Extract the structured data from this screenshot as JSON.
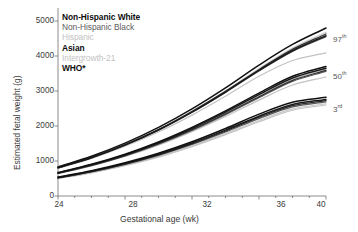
{
  "chart_data": {
    "type": "line",
    "title": "",
    "xlabel": "Gestational age (wk)",
    "ylabel": "Estimated fetal weight (g)",
    "xlim": [
      24,
      40
    ],
    "ylim": [
      0,
      5000
    ],
    "xticks": [
      24,
      28,
      32,
      36,
      40
    ],
    "yticks": [
      0,
      1000,
      2000,
      3000,
      4000,
      5000
    ],
    "xtick_labels": [
      "24",
      "28",
      "32",
      "36",
      "40"
    ],
    "ytick_labels": [
      "0",
      "1000",
      "2000",
      "3000",
      "4000",
      "5000"
    ],
    "grid": false,
    "legend_position": "upper-left",
    "x": [
      24,
      26,
      28,
      30,
      32,
      34,
      36,
      38,
      40
    ],
    "percentile_bands": [
      {
        "name": "97th",
        "label_text": "97",
        "label_suffix": "th",
        "series": [
          {
            "name": "Non-Hispanic White",
            "values": [
              830,
              1135,
              1510,
              1960,
              2490,
              3090,
              3740,
              4330,
              4800
            ]
          },
          {
            "name": "Non-Hispanic Black",
            "values": [
              800,
              1090,
              1450,
              1880,
              2390,
              2960,
              3570,
              4130,
              4550
            ]
          },
          {
            "name": "Hispanic",
            "values": [
              815,
              1110,
              1480,
              1915,
              2430,
              3010,
              3640,
              4230,
              4680
            ]
          },
          {
            "name": "Asian",
            "values": [
              805,
              1095,
              1455,
              1885,
              2395,
              2970,
              3590,
              4150,
              4580
            ]
          },
          {
            "name": "Intergrowth-21",
            "values": [
              790,
              1070,
              1420,
              1830,
              2310,
              2850,
              3420,
              3870,
              4090
            ]
          },
          {
            "name": "WHO*",
            "values": [
              810,
              1105,
              1470,
              1900,
              2415,
              2990,
              3610,
              4190,
              4630
            ]
          }
        ]
      },
      {
        "name": "50th",
        "label_text": "50",
        "label_suffix": "th",
        "series": [
          {
            "name": "Non-Hispanic White",
            "values": [
              670,
              905,
              1195,
              1545,
              1960,
              2430,
              2940,
              3420,
              3700
            ]
          },
          {
            "name": "Non-Hispanic Black",
            "values": [
              645,
              870,
              1145,
              1480,
              1875,
              2325,
              2810,
              3275,
              3560
            ]
          },
          {
            "name": "Hispanic",
            "values": [
              655,
              885,
              1165,
              1505,
              1910,
              2370,
              2865,
              3335,
              3620
            ]
          },
          {
            "name": "Asian",
            "values": [
              660,
              892,
              1175,
              1520,
              1930,
              2395,
              2895,
              3370,
              3650
            ]
          },
          {
            "name": "Intergrowth-21",
            "values": [
              640,
              860,
              1130,
              1455,
              1840,
              2275,
              2740,
              3170,
              3400
            ]
          },
          {
            "name": "WHO*",
            "values": [
              650,
              878,
              1155,
              1492,
              1892,
              2348,
              2838,
              3305,
              3590
            ]
          }
        ]
      },
      {
        "name": "3rd",
        "label_text": "3",
        "label_suffix": "rd",
        "series": [
          {
            "name": "Non-Hispanic White",
            "values": [
              540,
              722,
              948,
              1222,
              1550,
              1930,
              2340,
              2680,
              2820
            ]
          },
          {
            "name": "Non-Hispanic Black",
            "values": [
              512,
              686,
              900,
              1160,
              1470,
              1828,
              2212,
              2545,
              2690
            ]
          },
          {
            "name": "Hispanic",
            "values": [
              500,
              670,
              878,
              1130,
              1432,
              1782,
              2158,
              2490,
              2635
            ]
          },
          {
            "name": "Asian",
            "values": [
              528,
              706,
              926,
              1192,
              1512,
              1882,
              2280,
              2615,
              2760
            ]
          },
          {
            "name": "Intergrowth-21",
            "values": [
              495,
              662,
              866,
              1112,
              1408,
              1752,
              2122,
              2450,
              2600
            ]
          },
          {
            "name": "WHO*",
            "values": [
              520,
              696,
              912,
              1176,
              1490,
              1855,
              2245,
              2580,
              2725
            ]
          }
        ]
      }
    ],
    "series_styles": [
      {
        "name": "Non-Hispanic White",
        "color": "#111111",
        "width": 1.5
      },
      {
        "name": "Non-Hispanic Black",
        "color": "#5c5c5c",
        "width": 1.2
      },
      {
        "name": "Hispanic",
        "color": "#c9c9c9",
        "width": 1.2
      },
      {
        "name": "Asian",
        "color": "#1a1a1a",
        "width": 1.5
      },
      {
        "name": "Intergrowth-21",
        "color": "#c2c2c2",
        "width": 1.2
      },
      {
        "name": "WHO*",
        "color": "#2e2e2e",
        "width": 1.2
      }
    ]
  },
  "legend": {
    "items": [
      {
        "label": "Non-Hispanic White",
        "style": "lg-bold"
      },
      {
        "label": "Non-Hispanic Black",
        "style": "lg-dark"
      },
      {
        "label": "Hispanic",
        "style": "lg-light"
      },
      {
        "label": "Asian",
        "style": "lg-black"
      },
      {
        "label": "Intergrowth-21",
        "style": "lg-light"
      },
      {
        "label": "WHO*",
        "style": "lg-black"
      }
    ]
  },
  "axes": {
    "y_title": "Estimated fetal weight (g)",
    "x_title": "Gestational age (wk)",
    "y_ticks": [
      "5000",
      "4000",
      "3000",
      "2000",
      "1000",
      "0"
    ],
    "x_ticks": [
      "24",
      "28",
      "32",
      "36",
      "40"
    ]
  },
  "percentile_labels": [
    {
      "value": "97",
      "sup": "th"
    },
    {
      "value": "50",
      "sup": "th"
    },
    {
      "value": "3",
      "sup": "rd"
    }
  ],
  "colors": {
    "axis": "#6f6f6f",
    "text": "#3a3a3a",
    "background": "#ffffff"
  }
}
